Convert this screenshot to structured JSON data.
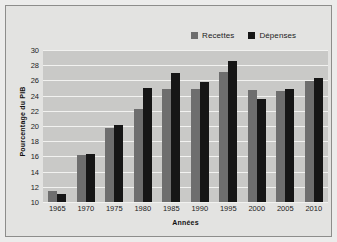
{
  "chart_data": {
    "type": "bar",
    "title": "",
    "xlabel": "Années",
    "ylabel": "Pourcentage du PIB",
    "categories": [
      "1965",
      "1970",
      "1975",
      "1980",
      "1985",
      "1990",
      "1995",
      "2000",
      "2005",
      "2010"
    ],
    "series": [
      {
        "name": "Recettes",
        "color": "#6e6e6e",
        "values": [
          11.4,
          16.2,
          19.8,
          22.3,
          24.9,
          24.9,
          27.1,
          24.7,
          24.6,
          25.9
        ]
      },
      {
        "name": "Dépenses",
        "color": "#161616",
        "values": [
          11.1,
          16.3,
          20.1,
          25.0,
          27.0,
          25.8,
          28.6,
          23.5,
          24.9,
          26.3
        ]
      }
    ],
    "ylim": [
      10,
      30
    ],
    "yticks": [
      10,
      12,
      14,
      16,
      18,
      20,
      22,
      24,
      26,
      28,
      30
    ],
    "ytick_labels": [
      "10",
      "12",
      "14",
      "16",
      "18",
      "20",
      "22",
      "24",
      "26",
      "28",
      "30"
    ],
    "grid": true,
    "grid_axis": "y",
    "legend_position": "top-right",
    "plot_background": "#c9c9c7",
    "figure_background": "#e3e3e1",
    "gridline_color": "#f2f2f0"
  },
  "legend": {
    "entries": [
      {
        "label": "Recettes",
        "color": "#6e6e6e"
      },
      {
        "label": "Dépenses",
        "color": "#161616"
      }
    ]
  },
  "axes": {
    "x_title": "Années",
    "y_title": "Pourcentage du PIB"
  }
}
